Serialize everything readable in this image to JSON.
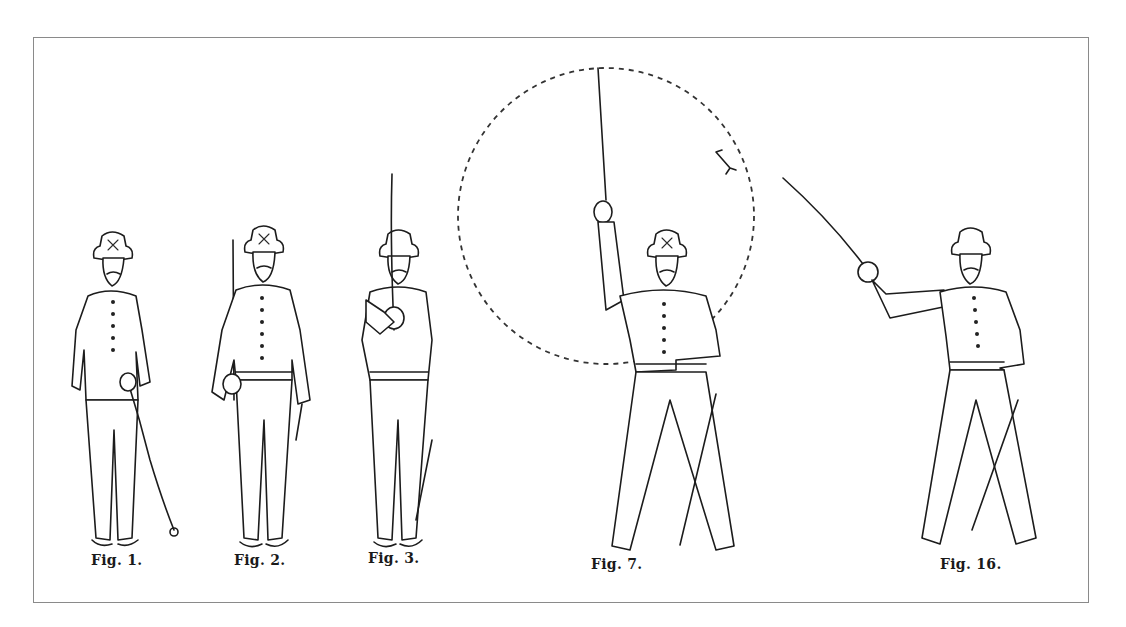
{
  "illustration": {
    "subject": "Saber drill positions",
    "frame_color": "#8a8a8a",
    "ink_color": "#1c1c1c",
    "figures": [
      {
        "id": "fig-1",
        "caption": "Fig. 1.",
        "pose": "saber sheathed, hand on hilt"
      },
      {
        "id": "fig-2",
        "caption": "Fig. 2.",
        "pose": "saber drawn, held upright at side"
      },
      {
        "id": "fig-3",
        "caption": "Fig. 3.",
        "pose": "saber held vertically before face"
      },
      {
        "id": "fig-7",
        "caption": "Fig. 7.",
        "pose": "saber raised overhead",
        "annotation": "dashed circle with clockwise arrow"
      },
      {
        "id": "fig-16",
        "caption": "Fig. 16.",
        "pose": "saber extended diagonally upward"
      }
    ]
  }
}
